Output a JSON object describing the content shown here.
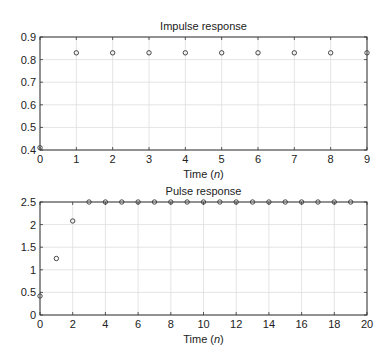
{
  "chart_data": [
    {
      "type": "scatter",
      "title": "Impulse response",
      "xlabel": "Time (n)",
      "ylabel": "",
      "xlim": [
        0,
        9
      ],
      "ylim": [
        0.4,
        0.9
      ],
      "xticks": [
        0,
        1,
        2,
        3,
        4,
        5,
        6,
        7,
        8,
        9
      ],
      "yticks": [
        0.4,
        0.5,
        0.6,
        0.7,
        0.8,
        0.9
      ],
      "ytick_labels": [
        "0.4",
        "0.5",
        "0.6",
        "0.7",
        "0.8",
        "0.9"
      ],
      "grid": true,
      "marker": "open-circle",
      "x": [
        0,
        1,
        2,
        3,
        4,
        5,
        6,
        7,
        8,
        9
      ],
      "values": [
        0.41,
        0.83,
        0.83,
        0.83,
        0.83,
        0.83,
        0.83,
        0.83,
        0.83,
        0.83
      ]
    },
    {
      "type": "scatter",
      "title": "Pulse response",
      "xlabel": "Time (n)",
      "ylabel": "",
      "xlim": [
        0,
        20
      ],
      "ylim": [
        0,
        2.5
      ],
      "xticks": [
        0,
        2,
        4,
        6,
        8,
        10,
        12,
        14,
        16,
        18,
        20
      ],
      "yticks": [
        0,
        0.5,
        1,
        1.5,
        2,
        2.5
      ],
      "ytick_labels": [
        "0",
        "0.5",
        "1",
        "1.5",
        "2",
        "2.5"
      ],
      "grid": true,
      "marker": "open-circle",
      "x": [
        0,
        1,
        2,
        3,
        4,
        5,
        6,
        7,
        8,
        9,
        10,
        11,
        12,
        13,
        14,
        15,
        16,
        17,
        18,
        19
      ],
      "values": [
        0.42,
        1.25,
        2.08,
        2.5,
        2.5,
        2.5,
        2.5,
        2.5,
        2.5,
        2.5,
        2.5,
        2.5,
        2.5,
        2.5,
        2.5,
        2.5,
        2.5,
        2.5,
        2.5,
        2.5
      ]
    }
  ],
  "colors": {
    "axis": "#333333",
    "grid": "#dddddd",
    "marker": "#444444"
  }
}
